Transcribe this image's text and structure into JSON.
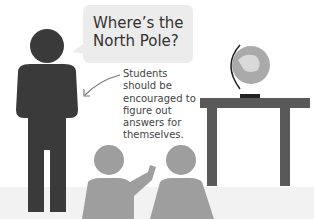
{
  "illustration": {
    "speech_bubble": {
      "text_line1": "Where’s the",
      "text_line2": "North Pole?"
    },
    "caption": {
      "text": "Students should be encouraged to figure out answers for themselves."
    },
    "colors": {
      "teacher": "#3a3a3a",
      "students": "#9e9e9e",
      "table": "#595959",
      "bubble": "#ececec",
      "floor": "#f2f2f2",
      "globe": "#aaaaaa"
    }
  }
}
